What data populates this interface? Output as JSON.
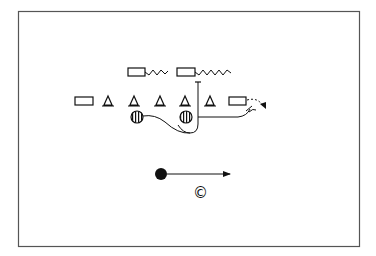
{
  "diagram": {
    "type": "football-play",
    "frame": {
      "x": 18,
      "y": 11,
      "width": 341,
      "height": 235,
      "stroke": "#555555"
    },
    "colors": {
      "ink": "#111111",
      "background": "#ffffff"
    },
    "offense_line": {
      "rectangles": [
        {
          "name": "left-end",
          "x": 75,
          "y": 97,
          "w": 18,
          "h": 8
        },
        {
          "name": "right-end",
          "x": 229,
          "y": 97,
          "w": 17,
          "h": 8
        }
      ],
      "triangles": [
        {
          "name": "lineman-1",
          "cx": 108
        },
        {
          "name": "lineman-2",
          "cx": 134
        },
        {
          "name": "lineman-3",
          "cx": 160
        },
        {
          "name": "lineman-4",
          "cx": 185
        },
        {
          "name": "lineman-5",
          "cx": 210
        }
      ],
      "triangle_apex_y": 96,
      "triangle_base_y": 106
    },
    "backs": {
      "rectangles": [
        {
          "name": "back-left",
          "x": 128,
          "y": 68,
          "w": 17,
          "h": 8,
          "zigzag_to": 168
        },
        {
          "name": "back-right",
          "x": 177,
          "y": 68,
          "w": 18,
          "h": 8,
          "zigzag_to": 232
        }
      ]
    },
    "striped_circles": [
      {
        "name": "blocker-1",
        "cx": 137,
        "cy": 117,
        "r": 6
      },
      {
        "name": "blocker-2",
        "cx": 186,
        "cy": 117,
        "r": 6
      }
    ],
    "ball_carrier": {
      "cx": 161,
      "cy": 174,
      "r": 6,
      "arrow_to_x": 230
    },
    "label": {
      "text": "©",
      "x": 193,
      "y": 186
    }
  }
}
